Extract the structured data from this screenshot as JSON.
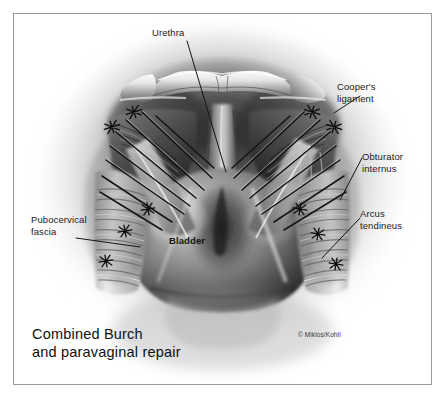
{
  "figure": {
    "title_line1": "Combined Burch",
    "title_line2": "and paravaginal repair",
    "title": "Combined Burch\nand paravaginal repair",
    "copyright": "© Miklos/Kohli",
    "medium": "grayscale airbrush medical illustration",
    "view": "retropubic space, superior view",
    "border_color": "#9a9a9a",
    "background_color": "#ffffff"
  },
  "labels": {
    "urethra": "Urethra",
    "coopers_ligament": "Cooper's\nligament",
    "obturator_internus": "Obturator\ninternus",
    "arcus_tendineus": "Arcus\ntendineus",
    "pubocervical_fascia": "Pubocervical\nfascia",
    "bladder": "Bladder"
  },
  "anatomy": {
    "structures": [
      "pubic bone",
      "urethra",
      "bladder",
      "pubocervical fascia",
      "obturator internus muscle",
      "arcus tendineus fasciae pelvis",
      "Cooper's ligament",
      "anterior vaginal wall"
    ],
    "ink_color": "#111111",
    "tissue_dark": "#2a2a2a",
    "tissue_mid": "#808080",
    "tissue_light": "#e8e8e8"
  },
  "sutures": {
    "description": "Burch colposuspension sutures to Cooper's ligament and paravaginal sutures to arcus tendineus",
    "knot_count_left": 5,
    "knot_count_right": 5,
    "strand_count_left": 8,
    "strand_count_right": 8,
    "color": "#141414"
  }
}
